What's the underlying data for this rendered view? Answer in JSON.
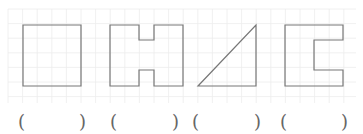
{
  "grid": {
    "x": 8,
    "y": 9,
    "width": 348,
    "height": 94,
    "cell": 14.6,
    "color": "#ececec"
  },
  "stroke_color": "#777777",
  "shapes": [
    {
      "name": "square",
      "points": "23,25 81,25 81,86 23,86"
    },
    {
      "name": "h-shape",
      "points": "110,25 139,25 139,40 154,40 154,25 183,25 183,86 154,86 154,70 139,70 139,86 110,86"
    },
    {
      "name": "right-triangle",
      "points": "198,86 256,25 256,86"
    },
    {
      "name": "c-shape",
      "points": "285,25 343,25 343,40 314,40 314,70 343,70 343,86 285,86"
    }
  ],
  "answer_blanks": [
    {
      "open": "(",
      "close": ")",
      "open_x": 18,
      "close_x": 79
    },
    {
      "open": "(",
      "close": ")",
      "open_x": 110,
      "close_x": 172
    },
    {
      "open": "(",
      "close": ")",
      "open_x": 192,
      "close_x": 254
    },
    {
      "open": "(",
      "close": ")",
      "open_x": 280,
      "close_x": 341
    }
  ]
}
